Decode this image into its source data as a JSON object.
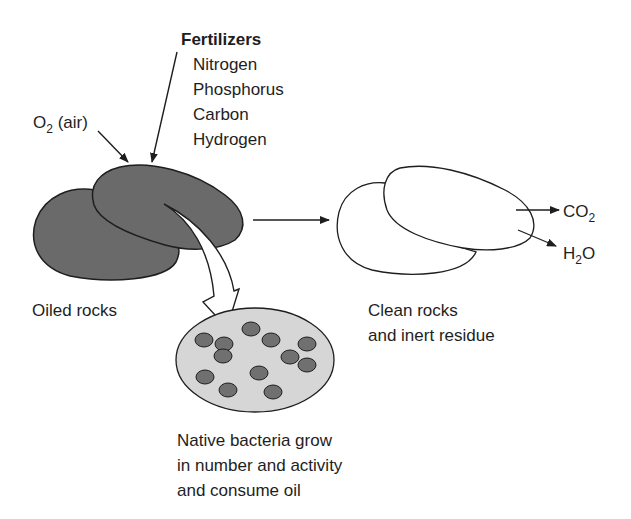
{
  "inputs": {
    "oxygen": {
      "label": "O",
      "subscript": "2",
      "suffix": " (air)"
    },
    "fertilizers": {
      "title": "Fertilizers",
      "items": [
        "Nitrogen",
        "Phosphorus",
        "Carbon",
        "Hydrogen"
      ]
    }
  },
  "stages": {
    "oiled_rocks": {
      "label": "Oiled rocks"
    },
    "clean_rocks": {
      "lines": [
        "Clean rocks",
        "and inert residue"
      ]
    },
    "bacteria": {
      "lines": [
        "Native bacteria grow",
        "in number and activity",
        "and consume oil"
      ]
    }
  },
  "outputs": {
    "co2": {
      "label": "CO",
      "subscript": "2"
    },
    "h2o": {
      "prefix": "H",
      "subscript": "2",
      "suffix": "O"
    }
  },
  "colors": {
    "oiled_rock_fill": "#6a6a6a",
    "dish_fill": "#d6d6d6",
    "bacteria_fill": "#707070",
    "stroke": "#1e1e1e",
    "clean_rock_fill": "#ffffff"
  }
}
